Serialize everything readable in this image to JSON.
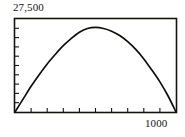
{
  "chart_data": {
    "type": "line",
    "title": "",
    "subtitle": "",
    "xlabel": "",
    "ylabel": "",
    "xlim": [
      0,
      1000
    ],
    "ylim": [
      0,
      27500
    ],
    "grid": false,
    "legend": null,
    "axis_labels": {
      "y_max": "27,500",
      "x_max": "1000"
    },
    "x_ticks": [
      0,
      100,
      200,
      300,
      400,
      500,
      600,
      700,
      800,
      900,
      1000
    ],
    "x_tick_labels": [
      "",
      "",
      "",
      "",
      "",
      "",
      "",
      "",
      "",
      "",
      "1000"
    ],
    "y_ticks": [
      0,
      2750,
      5500,
      8250,
      11000,
      13750,
      16500,
      19250,
      22000,
      24750,
      27500
    ],
    "y_tick_labels": [
      "",
      "",
      "",
      "",
      "",
      "",
      "",
      "",
      "",
      "",
      "27,500"
    ],
    "series": [
      {
        "name": "revenue-curve",
        "color": "#100f0b",
        "x": [
          0,
          50,
          100,
          150,
          200,
          250,
          300,
          350,
          400,
          450,
          500,
          550,
          600,
          650,
          700,
          750,
          800,
          850,
          900,
          950,
          1000
        ],
        "y": [
          0,
          3800,
          7600,
          11000,
          14200,
          17000,
          19600,
          21800,
          23600,
          24700,
          25000,
          24700,
          23900,
          22600,
          20800,
          18500,
          15700,
          12400,
          8900,
          4800,
          0
        ]
      }
    ],
    "annotations": []
  },
  "figure": {
    "background_color": "#ffffff",
    "axis_color": "#16140f",
    "curve_color": "#100f0b"
  }
}
